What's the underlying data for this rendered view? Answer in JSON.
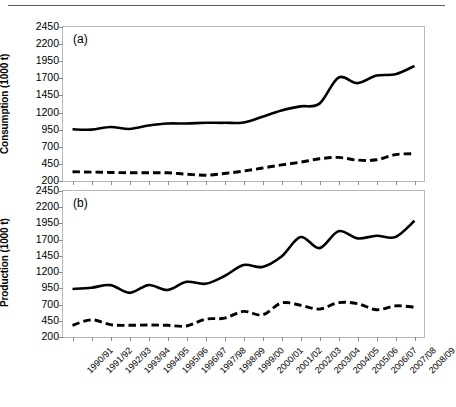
{
  "figure": {
    "panels": [
      {
        "tag": "(a)",
        "y_axis_title": "Consumption (1000 t)",
        "name": "consumption"
      },
      {
        "tag": "(b)",
        "y_axis_title": "Production (1000 t)",
        "name": "production"
      }
    ],
    "y_ticks": [
      200,
      450,
      700,
      950,
      1200,
      1450,
      1700,
      1950,
      2200,
      2450
    ],
    "x_categories": [
      "1990/91",
      "1991/92",
      "1992/93",
      "1993/94",
      "1994/95",
      "1995/96",
      "1996/97",
      "1997/98",
      "1998/99",
      "1999/00",
      "2000/01",
      "2001/02",
      "2002/03",
      "2003/04",
      "2004/05",
      "2005/06",
      "2006/07",
      "2007/08",
      "2008/09"
    ],
    "line_color": "#000000",
    "frame_color": "#b9b9b9"
  },
  "chart_data": [
    {
      "type": "line",
      "panel": "(a)",
      "title": "",
      "xlabel": "",
      "ylabel": "Consumption (1000 t)",
      "ylim": [
        200,
        2450
      ],
      "ytick_step": 250,
      "grid": false,
      "legend": "none",
      "categories": [
        "1990/91",
        "1991/92",
        "1992/93",
        "1993/94",
        "1994/95",
        "1995/96",
        "1996/97",
        "1997/98",
        "1998/99",
        "1999/00",
        "2000/01",
        "2001/02",
        "2002/03",
        "2003/04",
        "2004/05",
        "2005/06",
        "2006/07",
        "2007/08",
        "2008/09"
      ],
      "series": [
        {
          "name": "total-consumption",
          "style": "solid",
          "values": [
            955,
            950,
            990,
            960,
            1010,
            1040,
            1040,
            1050,
            1050,
            1055,
            1140,
            1230,
            1290,
            1330,
            1710,
            1630,
            1740,
            1760,
            1880
          ]
        },
        {
          "name": "secondary-consumption",
          "style": "dashed",
          "values": [
            335,
            330,
            325,
            320,
            320,
            320,
            300,
            285,
            310,
            345,
            390,
            435,
            475,
            525,
            545,
            505,
            510,
            585,
            600
          ]
        }
      ]
    },
    {
      "type": "line",
      "panel": "(b)",
      "title": "",
      "xlabel": "",
      "ylabel": "Production (1000 t)",
      "ylim": [
        200,
        2450
      ],
      "ytick_step": 250,
      "grid": false,
      "legend": "none",
      "categories": [
        "1990/91",
        "1991/92",
        "1992/93",
        "1993/94",
        "1994/95",
        "1995/96",
        "1996/97",
        "1997/98",
        "1998/99",
        "1999/00",
        "2000/01",
        "2001/02",
        "2002/03",
        "2003/04",
        "2004/05",
        "2005/06",
        "2006/07",
        "2007/08",
        "2008/09"
      ],
      "series": [
        {
          "name": "total-production",
          "style": "solid",
          "values": [
            940,
            960,
            1000,
            880,
            1000,
            925,
            1050,
            1020,
            1140,
            1310,
            1280,
            1440,
            1740,
            1570,
            1830,
            1720,
            1760,
            1740,
            1990
          ]
        },
        {
          "name": "secondary-production",
          "style": "dashed",
          "values": [
            380,
            465,
            390,
            380,
            385,
            380,
            370,
            475,
            490,
            595,
            540,
            725,
            690,
            630,
            730,
            715,
            620,
            680,
            660
          ]
        }
      ]
    }
  ]
}
